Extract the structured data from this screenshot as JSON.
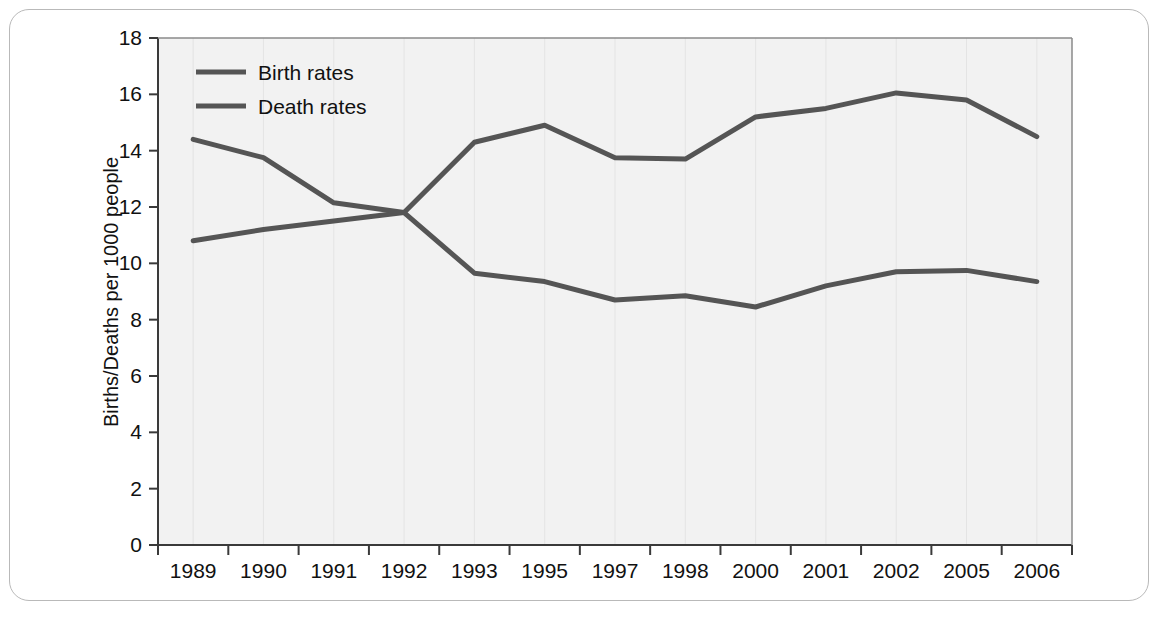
{
  "chart_data": {
    "type": "line",
    "title": "",
    "xlabel": "",
    "ylabel": "Births/Deaths per 1000 people",
    "categories": [
      "1989",
      "1990",
      "1991",
      "1992",
      "1993",
      "1995",
      "1997",
      "1998",
      "2000",
      "2001",
      "2002",
      "2005",
      "2006"
    ],
    "series": [
      {
        "name": "Birth rates",
        "color": "#555555",
        "values": [
          10.8,
          11.2,
          11.5,
          11.8,
          14.3,
          14.9,
          13.75,
          13.7,
          15.2,
          15.5,
          16.05,
          15.8,
          14.5
        ]
      },
      {
        "name": "Death rates",
        "color": "#555555",
        "values": [
          14.4,
          13.75,
          12.15,
          11.8,
          9.65,
          9.35,
          8.7,
          8.85,
          8.45,
          9.2,
          9.7,
          9.75,
          9.35
        ]
      }
    ],
    "ylim": [
      0,
      18
    ],
    "yticks": [
      0,
      2,
      4,
      6,
      8,
      10,
      12,
      14,
      16,
      18
    ],
    "ytick_labels": [
      "0",
      "2",
      "4",
      "6",
      "8",
      "10",
      "12",
      "14",
      "16",
      "18"
    ],
    "grid": "vertical-faint",
    "legend_position": "top-left-inside",
    "plot_background": "#f2f2f2",
    "axis_color": "#3a3a3a"
  },
  "legend": {
    "entries": [
      {
        "label": "Birth rates"
      },
      {
        "label": "Death rates"
      }
    ]
  },
  "axes": {
    "y_title": "Births/Deaths per 1000 people"
  }
}
